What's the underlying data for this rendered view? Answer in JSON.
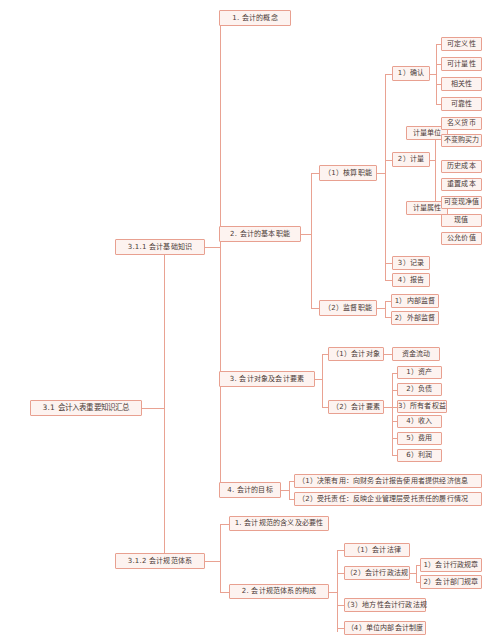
{
  "diagram": {
    "title": "3.1 会计入表重要知识汇总",
    "type": "mindmap",
    "accent_color": "#e8a090",
    "node_fill": "#fdf3f0",
    "text_color": "#4a3a36"
  },
  "nodes": {
    "root": "3.1 会计入表重要知识汇总",
    "l1": {
      "basic": "3.1.1 会计基础知识",
      "norms": "3.1.2 会计规范体系"
    },
    "basic_children": {
      "concept": "1. 会计的概念",
      "functions": "2. 会计的基本职能",
      "objects": "3. 会计对象及会计要素",
      "goals": "4. 会计的目标"
    },
    "functions_children": {
      "accounting": "（1）核算职能",
      "supervision": "（2）监督职能"
    },
    "accounting_children": {
      "confirm": "1）确认",
      "measure": "2）计量",
      "record": "3）记录",
      "report": "4）报告"
    },
    "confirm_children": [
      "可定义性",
      "可计量性",
      "相关性",
      "可靠性"
    ],
    "measure_children": {
      "unit": "计量单位",
      "attribute": "计量属性"
    },
    "unit_children": [
      "名义货币",
      "不变购买力"
    ],
    "attribute_children": [
      "历史成本",
      "重置成本",
      "可变现净值",
      "现值",
      "公允价值"
    ],
    "supervision_children": [
      "1）内部监督",
      "2）外部监督"
    ],
    "objects_children": {
      "object": "（1）会计对象",
      "elements": "（2）会计要素"
    },
    "object_children": [
      "资金流动"
    ],
    "elements_children": [
      "1）资产",
      "2）负债",
      "3）所有者权益",
      "4）收入",
      "5）费用",
      "6）利润"
    ],
    "goals_children": [
      "（1）决策有用：向财务会计报告使用者提供经济信息",
      "（2）受托责任：反映企业管理层受托责任的履行情况"
    ],
    "norms_children": {
      "meaning": "1. 会计规范的含义及必要性",
      "structure": "2. 会计规范体系的构成"
    },
    "structure_children": {
      "law": "（1）会计法律",
      "admin": "（2）会计行政法规",
      "local": "（3）地方性会计行政法规",
      "internal": "（4）单位内部会计制度"
    },
    "admin_children": [
      "1）会计行政规章",
      "2）会计部门规章"
    ]
  }
}
